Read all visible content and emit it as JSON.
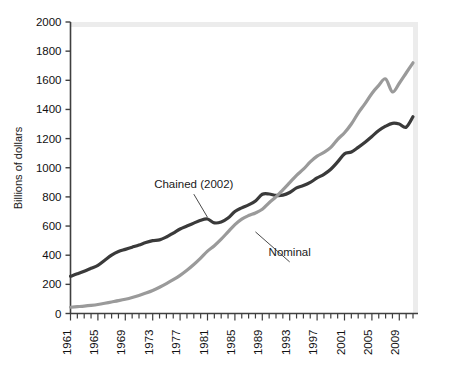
{
  "chart_data": {
    "type": "line",
    "title": "",
    "subtitle": "",
    "xlabel": "",
    "ylabel": "Billions of dollars",
    "xlim": [
      1961,
      2011
    ],
    "ylim": [
      0,
      2000
    ],
    "grid": false,
    "legend_position": "inline-annotations",
    "y_ticks": [
      0,
      200,
      400,
      600,
      800,
      1000,
      1200,
      1400,
      1600,
      1800,
      2000
    ],
    "y_tick_labels": [
      "0",
      "200",
      "400",
      "600",
      "800",
      "1000",
      "1200",
      "1400",
      "1600",
      "1800",
      "2000"
    ],
    "x_tick_labels": [
      "1961",
      "1965",
      "1969",
      "1973",
      "1977",
      "1981",
      "1985",
      "1989",
      "1993",
      "1997",
      "2001",
      "2005",
      "2009"
    ],
    "x_labeled_years": [
      1961,
      1965,
      1969,
      1973,
      1977,
      1981,
      1985,
      1989,
      1993,
      1997,
      2001,
      2005,
      2009
    ],
    "x_minor_tick_interval": 1,
    "x": [
      1961,
      1962,
      1963,
      1964,
      1965,
      1966,
      1967,
      1968,
      1969,
      1970,
      1971,
      1972,
      1973,
      1974,
      1975,
      1976,
      1977,
      1978,
      1979,
      1980,
      1981,
      1982,
      1983,
      1984,
      1985,
      1986,
      1987,
      1988,
      1989,
      1990,
      1991,
      1992,
      1993,
      1994,
      1995,
      1996,
      1997,
      1998,
      1999,
      2000,
      2001,
      2002,
      2003,
      2004,
      2005,
      2006,
      2007,
      2008,
      2009,
      2010,
      2011
    ],
    "series": [
      {
        "name": "Chained (2002)",
        "label": "Chained (2002)",
        "color": "#3a3a3a",
        "linewidth": 3.2,
        "values": [
          255,
          272,
          290,
          310,
          330,
          365,
          400,
          425,
          440,
          455,
          470,
          487,
          500,
          505,
          525,
          552,
          580,
          600,
          620,
          640,
          648,
          622,
          628,
          655,
          700,
          725,
          745,
          772,
          818,
          820,
          810,
          812,
          830,
          862,
          878,
          900,
          930,
          955,
          990,
          1040,
          1095,
          1108,
          1140,
          1175,
          1215,
          1255,
          1285,
          1305,
          1300,
          1278,
          1350
        ]
      },
      {
        "name": "Nominal",
        "label": "Nominal",
        "color": "#9a9a9a",
        "linewidth": 3.2,
        "values": [
          43,
          47,
          51,
          56,
          62,
          70,
          79,
          88,
          98,
          110,
          124,
          140,
          158,
          180,
          205,
          232,
          262,
          297,
          336,
          380,
          428,
          465,
          510,
          560,
          610,
          648,
          672,
          690,
          715,
          760,
          800,
          848,
          898,
          948,
          990,
          1040,
          1080,
          1105,
          1140,
          1195,
          1240,
          1300,
          1375,
          1440,
          1510,
          1565,
          1610,
          1520,
          1580,
          1650,
          1720
        ]
      }
    ],
    "annotations": [
      {
        "id": "chained-label",
        "text": "Chained (2002)",
        "x": 1979,
        "y": 860,
        "leader_to_x": 1981,
        "leader_to_y": 660
      },
      {
        "id": "nominal-label",
        "text": "Nominal",
        "x": 1993,
        "y": 395,
        "leader_to_x": 1988,
        "leader_to_y": 560
      }
    ]
  }
}
